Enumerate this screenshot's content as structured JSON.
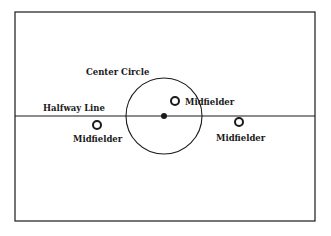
{
  "diagram": {
    "type": "soccer-field-half-view",
    "colors": {
      "line": "#1a1a1a",
      "background": "#ffffff"
    },
    "field": {
      "x": 15,
      "y": 12,
      "width": 300,
      "height": 209
    },
    "halfway_line": {
      "y": 116,
      "label": "Halfway Line",
      "label_x": 43,
      "label_y": 111
    },
    "center_circle": {
      "cx": 164,
      "cy": 116,
      "r": 38,
      "label": "Center Circle",
      "label_x": 86,
      "label_y": 75
    },
    "center_spot": {
      "cx": 164,
      "cy": 116,
      "r": 3
    },
    "players": [
      {
        "role": "Midfielder",
        "cx": 175,
        "cy": 101,
        "label_x": 185,
        "label_y": 105
      },
      {
        "role": "Midfielder",
        "cx": 97,
        "cy": 125,
        "label_x": 73,
        "label_y": 142
      },
      {
        "role": "Midfielder",
        "cx": 239,
        "cy": 122,
        "label_x": 216,
        "label_y": 141
      }
    ]
  }
}
